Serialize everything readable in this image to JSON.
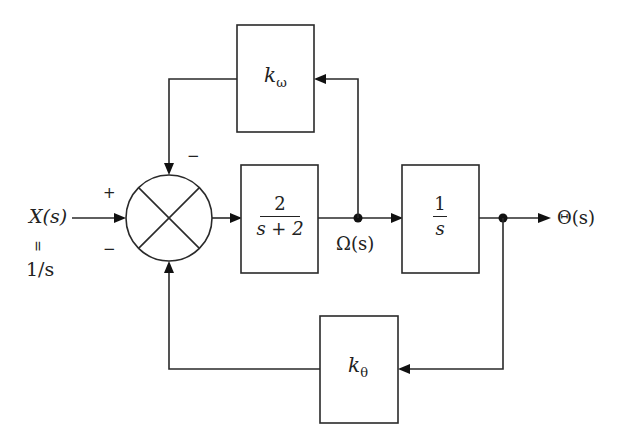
{
  "diagram": {
    "type": "control-block-diagram",
    "input": {
      "label": "X(s)",
      "equals": "=",
      "value": "1/s"
    },
    "summing_junction": {
      "signs": {
        "input": "+",
        "bottom_feedback": "−",
        "top_feedback": "−"
      }
    },
    "blocks": {
      "plant": {
        "numerator": "2",
        "denominator": "s + 2"
      },
      "integrator": {
        "numerator": "1",
        "denominator": "s"
      },
      "velocity_gain": {
        "symbol": "k",
        "subscript": "ω"
      },
      "position_gain": {
        "symbol": "k",
        "subscript": "θ"
      }
    },
    "signals": {
      "intermediate": "Ω(s)",
      "output": "Θ(s)"
    },
    "colors": {
      "line": "#2a2a2a",
      "background": "#ffffff"
    }
  }
}
